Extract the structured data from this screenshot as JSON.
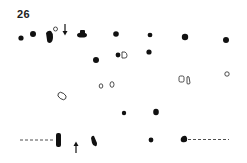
{
  "figure": {
    "label": "26",
    "ink_color": "#111111",
    "background": "#ffffff"
  },
  "markers": {
    "arrow_top": "arrow-down-icon",
    "arrow_bottom": "arrow-up-icon"
  }
}
